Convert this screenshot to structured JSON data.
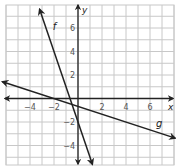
{
  "chart_data": {
    "type": "line",
    "title": "",
    "xlabel": "x",
    "ylabel": "y",
    "xlim": [
      -6.5,
      8.2
    ],
    "ylim": [
      -5.8,
      8.3
    ],
    "grid": true,
    "x_ticks": [
      -4,
      -2,
      2,
      4,
      6
    ],
    "y_ticks": [
      6,
      4,
      2,
      -2,
      -4
    ],
    "x_tick_labels": [
      "−4",
      "−2",
      "2",
      "4",
      "6"
    ],
    "y_tick_labels": [
      "6",
      "4",
      "2",
      "−2",
      "−4"
    ],
    "series": [
      {
        "name": "f",
        "label": "f",
        "slope": -3,
        "intercept": -2,
        "points": [
          [
            -3.2,
            7.6
          ],
          [
            1.2,
            -5.6
          ]
        ],
        "label_position": [
          -2.1,
          5.8
        ]
      },
      {
        "name": "g",
        "label": "g",
        "slope": -0.333,
        "intercept": -0.667,
        "points": [
          [
            -6.3,
            1.43
          ],
          [
            8.1,
            -3.37
          ]
        ],
        "label_position": [
          6.5,
          -2.4
        ]
      }
    ],
    "legend": "none"
  },
  "colors": {
    "grid": "#c8c8c8",
    "axis": "#222222",
    "line": "#222222",
    "tick_label": "#555555"
  }
}
